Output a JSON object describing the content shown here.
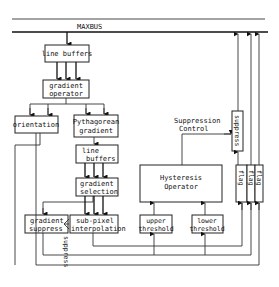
{
  "diagram": {
    "bus_label": "MAXBUS",
    "boxes": {
      "line_buffers_top": [
        "line buffers"
      ],
      "gradient_operator": [
        "gradient",
        "operator"
      ],
      "orientation": [
        "orientation"
      ],
      "pythagorean_gradient": [
        "Pythagorean",
        "gradient"
      ],
      "line_buffers_mid": [
        "line",
        "buffers"
      ],
      "gradient_selection": [
        "gradient",
        "selection"
      ],
      "gradient_suppress": [
        "gradient",
        "suppress"
      ],
      "subpixel_interpolation": [
        "sub-pixel",
        "interpolation"
      ],
      "hysteresis_operator": [
        "Hysteresis",
        "Operator"
      ],
      "upper_threshold": [
        "upper",
        "threshold"
      ],
      "lower_threshold": [
        "lower",
        "threshold"
      ],
      "suppress_box": "suppress",
      "flag_boxes": [
        "flag",
        "flag",
        "flag"
      ]
    },
    "annotations": {
      "suppression_control": [
        "Suppression",
        "Control"
      ],
      "suppress_vertical": "suppress"
    }
  }
}
